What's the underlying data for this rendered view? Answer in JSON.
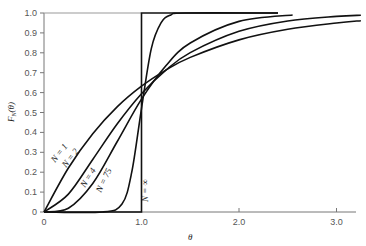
{
  "chart_data": {
    "type": "line",
    "title": "",
    "xlabel": "θ",
    "ylabel": "F_N(θ)",
    "xlim": [
      0,
      3.25
    ],
    "ylim": [
      0,
      1.0
    ],
    "xticks": [
      "0",
      "1.0",
      "2.0",
      "3.0"
    ],
    "yticks": [
      "0",
      "0.1",
      "0.2",
      "0.3",
      "0.4",
      "0.5",
      "0.6",
      "0.7",
      "0.8",
      "0.9",
      "1.0"
    ],
    "grid": false,
    "series": [
      {
        "name": "N = 1",
        "x": [
          0,
          0.25,
          0.5,
          0.75,
          1,
          1.25,
          1.5,
          2,
          2.5,
          3,
          3.25
        ],
        "y": [
          0,
          0.221,
          0.393,
          0.528,
          0.632,
          0.713,
          0.777,
          0.865,
          0.918,
          0.95,
          0.961
        ]
      },
      {
        "name": "N = 2",
        "x": [
          0,
          0.25,
          0.5,
          0.75,
          1,
          1.25,
          1.5,
          2,
          2.5,
          3,
          3.25
        ],
        "y": [
          0,
          0.09,
          0.264,
          0.442,
          0.594,
          0.713,
          0.801,
          0.908,
          0.96,
          0.983,
          0.989
        ]
      },
      {
        "name": "N = 4",
        "x": [
          0,
          0.25,
          0.5,
          0.75,
          1,
          1.25,
          1.5,
          2,
          2.55
        ],
        "y": [
          0,
          0.019,
          0.143,
          0.353,
          0.567,
          0.735,
          0.849,
          0.958,
          0.99
        ]
      },
      {
        "name": "N = 75",
        "x": [
          0,
          0.6,
          0.8,
          0.9,
          1.0,
          1.1,
          1.2,
          1.3,
          1.45,
          2.4
        ],
        "y": [
          0,
          0,
          0.04,
          0.2,
          0.52,
          0.82,
          0.95,
          0.99,
          1,
          1
        ]
      },
      {
        "name": "N = ∞",
        "x": [
          0,
          1,
          1,
          2.4
        ],
        "y": [
          0,
          0,
          1,
          1
        ]
      }
    ]
  }
}
